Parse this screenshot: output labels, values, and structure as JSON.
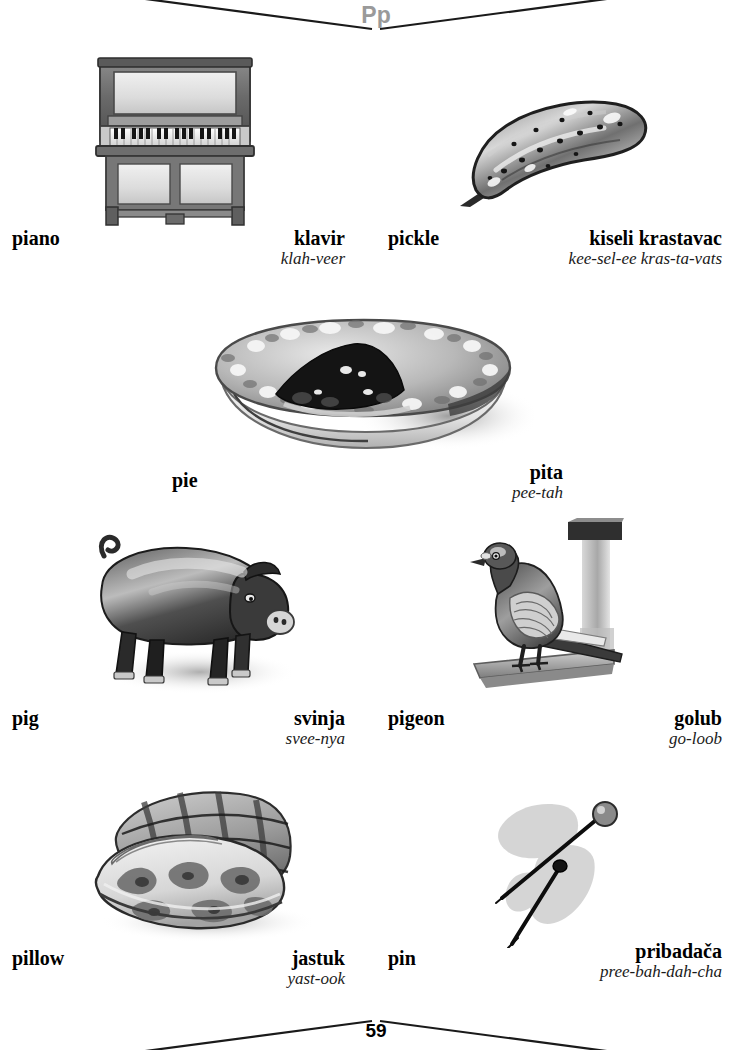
{
  "page": {
    "letter_heading": "Pp",
    "page_number": "59",
    "language_pair": "English / Serbian-Croatian picture dictionary"
  },
  "entries": [
    {
      "id": "piano",
      "english": "piano",
      "translation": "klavir",
      "pronunciation": "klah-veer",
      "illustration": "upright-piano-illustration"
    },
    {
      "id": "pickle",
      "english": "pickle",
      "translation": "kiseli krastavac",
      "pronunciation": "kee-sel-ee kras-ta-vats",
      "illustration": "pickle-illustration"
    },
    {
      "id": "pie",
      "english": "pie",
      "translation": "pita",
      "pronunciation": "pee-tah",
      "illustration": "pie-illustration"
    },
    {
      "id": "pig",
      "english": "pig",
      "translation": "svinja",
      "pronunciation": "svee-nya",
      "illustration": "pig-illustration"
    },
    {
      "id": "pigeon",
      "english": "pigeon",
      "translation": "golub",
      "pronunciation": "go-loob",
      "illustration": "pigeon-illustration"
    },
    {
      "id": "pillow",
      "english": "pillow",
      "translation": "jastuk",
      "pronunciation": "yast-ook",
      "illustration": "pillow-illustration"
    },
    {
      "id": "pin",
      "english": "pin",
      "translation": "pribadača",
      "pronunciation": "pree-bah-dah-cha",
      "illustration": "pin-illustration"
    }
  ],
  "colors": {
    "heading_gray": "#9a9a9a",
    "text_black": "#000000",
    "rule_black": "#1a1a1a",
    "page_background": "#ffffff"
  }
}
